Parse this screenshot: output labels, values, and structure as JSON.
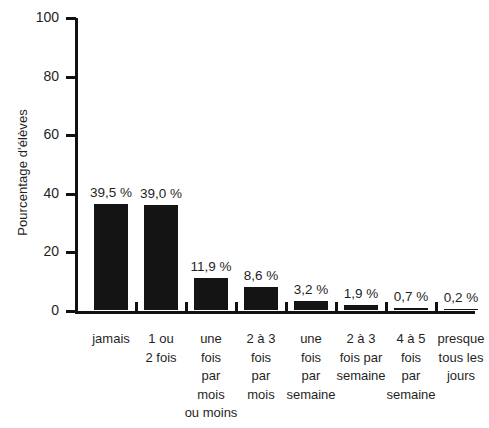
{
  "chart_data": {
    "type": "bar",
    "title": "",
    "subtitle": "",
    "xlabel": "",
    "ylabel": "Pourcentage d'élèves",
    "ylim": [
      0,
      100
    ],
    "grid": false,
    "legend": "none",
    "orientation": "vertical",
    "bar_color": "#141414",
    "axis_color": "#111111",
    "background_color": "#ffffff",
    "y_ticks": [
      "0",
      "20",
      "40",
      "60",
      "80",
      "100"
    ],
    "y_tick_values": [
      0,
      20,
      40,
      60,
      80,
      100
    ],
    "categories": [
      "jamais",
      "1 ou 2 fois",
      "une fois par mois ou moins",
      "2 à 3 fois par mois",
      "une fois par semaine",
      "2 à 3 fois par semaine",
      "4 à 5 fois par semaine",
      "presque tous les jours"
    ],
    "category_lines": [
      [
        "jamais"
      ],
      [
        "1 ou",
        "2 fois"
      ],
      [
        "une",
        "fois",
        "par",
        "mois",
        "ou moins"
      ],
      [
        "2 à 3",
        "fois",
        "par",
        "mois"
      ],
      [
        "une",
        "fois",
        "par",
        "semaine"
      ],
      [
        "2 à 3",
        "fois par",
        "semaine"
      ],
      [
        "4 à 5",
        "fois",
        "par",
        "semaine"
      ],
      [
        "presque",
        "tous les",
        "jours"
      ]
    ],
    "values": [
      39.5,
      39.0,
      11.9,
      8.6,
      3.2,
      1.9,
      0.7,
      0.2
    ],
    "value_labels": [
      "39,5 %",
      "39,0 %",
      "11,9 %",
      "8,6 %",
      "3,2 %",
      "1,9 %",
      "0,7 %",
      "0,2 %"
    ]
  }
}
